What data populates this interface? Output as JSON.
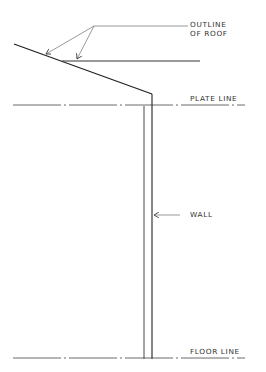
{
  "diagram": {
    "type": "architectural-section-sketch",
    "stroke_color": "#2a2a2a",
    "thin_stroke_color": "#555555",
    "labels": {
      "outline_of_roof_line1": "OUTLINE",
      "outline_of_roof_line2": "OF ROOF",
      "plate_line": "PLATE LINE",
      "wall": "WALL",
      "floor_line": "FLOOR LINE"
    },
    "elements": [
      {
        "name": "roof-outline",
        "kind": "sloped line + horizontal overhang line"
      },
      {
        "name": "plate-line",
        "kind": "dash-dot horizontal reference line"
      },
      {
        "name": "wall",
        "kind": "double vertical line"
      },
      {
        "name": "floor-line",
        "kind": "dash-dot horizontal reference line"
      }
    ]
  }
}
